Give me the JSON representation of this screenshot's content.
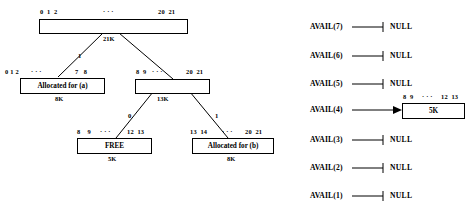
{
  "figure": {
    "title": "",
    "tree": {
      "nodes": [
        {
          "id": "root",
          "label": "",
          "size_label": "21K",
          "index_left": "0  1  2",
          "index_mid": "· · ·",
          "index_right": "20  21"
        },
        {
          "id": "alloc-a",
          "label": "Allocated for (a)",
          "size_label": "8K",
          "index_left": "0 1 2",
          "index_mid": "· · ·",
          "index_right": "7   8"
        },
        {
          "id": "node-13k",
          "label": "",
          "size_label": "13K",
          "index_left": "8  9",
          "index_mid": "· · ·",
          "index_right": "20  21"
        },
        {
          "id": "free",
          "label": "FREE",
          "size_label": "5K",
          "index_left": "8    9",
          "index_mid": "· · ·",
          "index_right": "12  13"
        },
        {
          "id": "alloc-b",
          "label": "Allocated for (b)",
          "size_label": "8K",
          "index_left": "13  14",
          "index_mid": "· · ·",
          "index_right": "20  21"
        }
      ],
      "edge_labels": {
        "root_left": "1",
        "root_right": "",
        "n13k_left": "0",
        "n13k_right": "1"
      }
    },
    "avail_list": {
      "rows": [
        {
          "name": "AVAIL(7)",
          "target": "NULL",
          "has_block": false,
          "block_size": "",
          "block_index_left": "",
          "block_index_mid": "",
          "block_index_right": ""
        },
        {
          "name": "AVAIL(6)",
          "target": "NULL",
          "has_block": false,
          "block_size": "",
          "block_index_left": "",
          "block_index_mid": "",
          "block_index_right": ""
        },
        {
          "name": "AVAIL(5)",
          "target": "NULL",
          "has_block": false,
          "block_size": "",
          "block_index_left": "",
          "block_index_mid": "",
          "block_index_right": ""
        },
        {
          "name": "AVAIL(4)",
          "target": "",
          "has_block": true,
          "block_size": "5K",
          "block_index_left": "8  9",
          "block_index_mid": "· · ·",
          "block_index_right": "12  13"
        },
        {
          "name": "AVAIL(3)",
          "target": "NULL",
          "has_block": false,
          "block_size": "",
          "block_index_left": "",
          "block_index_mid": "",
          "block_index_right": ""
        },
        {
          "name": "AVAIL(2)",
          "target": "NULL",
          "has_block": false,
          "block_size": "",
          "block_index_left": "",
          "block_index_mid": "",
          "block_index_right": ""
        },
        {
          "name": "AVAIL(1)",
          "target": "NULL",
          "has_block": false,
          "block_size": "",
          "block_index_left": "",
          "block_index_mid": "",
          "block_index_right": ""
        }
      ]
    },
    "colors": {
      "stroke": "#000000",
      "background": "#ffffff"
    }
  }
}
